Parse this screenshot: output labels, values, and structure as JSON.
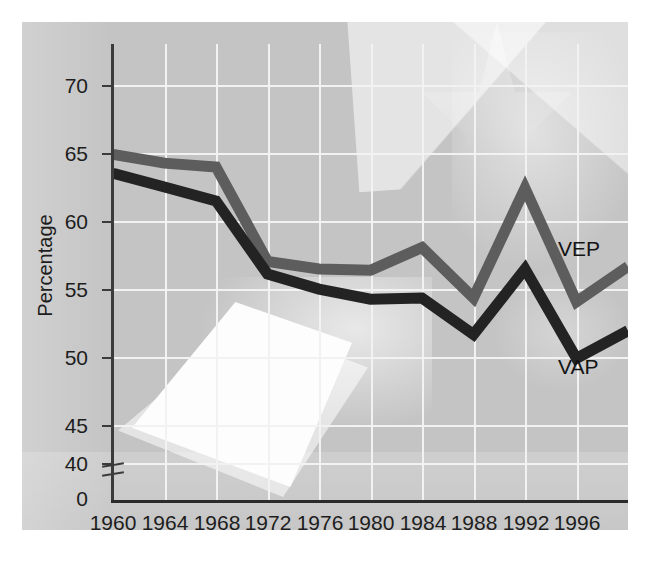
{
  "chart_data": {
    "type": "line",
    "title": "",
    "subtitle": "",
    "xlabel": "Year",
    "ylabel": "Percentage",
    "xlim": [
      1960,
      2000
    ],
    "ylim": [
      37,
      72
    ],
    "grid": true,
    "legend_position": "inline-right-end",
    "y_axis_break": true,
    "y_axis_break_symbol": "axis-break-marks",
    "x_ticks": [
      1960,
      1964,
      1968,
      1972,
      1976,
      1980,
      1984,
      1988,
      1992,
      1996
    ],
    "x_tick_labels": [
      "1960",
      "1964",
      "1968",
      "1972",
      "1976",
      "1980",
      "1984",
      "1988",
      "1992",
      "1996"
    ],
    "y_ticks": [
      0,
      40,
      45,
      50,
      55,
      60,
      65,
      70
    ],
    "y_tick_labels": [
      "0",
      "40",
      "45",
      "50",
      "55",
      "60",
      "65",
      "70"
    ],
    "x": [
      1960,
      1964,
      1968,
      1972,
      1976,
      1980,
      1984,
      1988,
      1992,
      1996,
      2000
    ],
    "series": [
      {
        "name": "VEP",
        "label": "VEP",
        "color": "#5d5d5d",
        "values": [
          64.5,
          63.8,
          63.5,
          56.0,
          55.4,
          55.3,
          57.1,
          53.1,
          61.8,
          52.8,
          55.6
        ]
      },
      {
        "name": "VAP",
        "label": "VAP",
        "color": "#232323",
        "values": [
          63.0,
          61.9,
          60.8,
          55.0,
          53.8,
          53.0,
          53.1,
          50.2,
          55.4,
          48.3,
          50.5
        ]
      }
    ],
    "annotations": [
      {
        "text": "VEP",
        "x": 1996,
        "y": 57.5
      },
      {
        "text": "VAP",
        "x": 1996,
        "y": 47.0
      }
    ],
    "colors": {
      "panel_background": "#c4c4c4",
      "gridline": "#f2f2f2",
      "axis": "#2b2b2b",
      "text": "#1d1d1d",
      "vep_line": "#5d5d5d",
      "vap_line": "#232323"
    },
    "background_image_description": "faint photograph of a hand placing a ballot paper, with star/flag shapes"
  }
}
